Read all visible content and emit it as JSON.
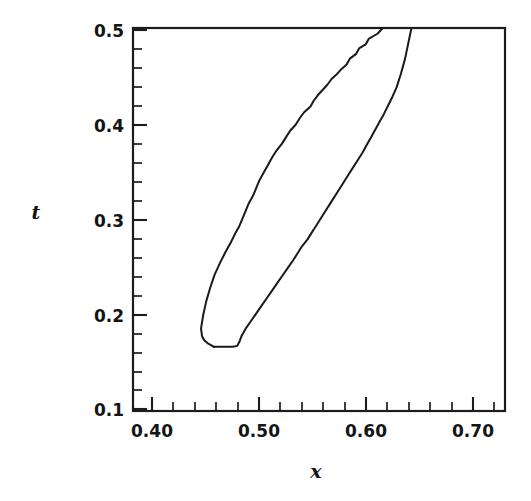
{
  "chart_data": {
    "type": "line",
    "title": "",
    "subtitle": "",
    "xlabel": "x",
    "ylabel": "t",
    "xlim": [
      0.37,
      0.72
    ],
    "ylim": [
      0.1,
      0.5
    ],
    "grid": false,
    "legend": null,
    "annotations": [],
    "x_tick_labels": [
      "0.40",
      "0.50",
      "0.60",
      "0.70"
    ],
    "x_tick_values": [
      0.4,
      0.5,
      0.6,
      0.7
    ],
    "y_tick_labels": [
      "0.1",
      "0.2",
      "0.3",
      "0.4",
      "0.5"
    ],
    "y_tick_values": [
      0.1,
      0.2,
      0.3,
      0.4,
      0.5
    ],
    "x_minor_per_interval": 4,
    "y_minor_per_interval": 4,
    "series": [
      {
        "name": "contour-left-branch",
        "comment": "left boundary of the band, traced from the top edge downward to the closed bottom tip",
        "x": [
          0.605,
          0.6,
          0.592,
          0.589,
          0.583,
          0.58,
          0.574,
          0.571,
          0.566,
          0.562,
          0.557,
          0.553,
          0.549,
          0.544,
          0.54,
          0.537,
          0.531,
          0.527,
          0.523,
          0.518,
          0.514,
          0.51,
          0.505,
          0.501,
          0.497,
          0.493,
          0.489,
          0.486,
          0.483,
          0.479,
          0.476,
          0.473,
          0.47,
          0.466,
          0.462,
          0.457,
          0.452,
          0.447,
          0.443,
          0.439,
          0.436,
          0.434,
          0.435,
          0.437,
          0.44,
          0.443,
          0.446
        ],
        "t": [
          0.5,
          0.494,
          0.489,
          0.483,
          0.479,
          0.473,
          0.468,
          0.462,
          0.457,
          0.452,
          0.447,
          0.441,
          0.436,
          0.43,
          0.424,
          0.418,
          0.412,
          0.406,
          0.399,
          0.393,
          0.386,
          0.379,
          0.372,
          0.365,
          0.357,
          0.349,
          0.341,
          0.333,
          0.325,
          0.317,
          0.309,
          0.301,
          0.293,
          0.285,
          0.276,
          0.266,
          0.255,
          0.243,
          0.23,
          0.215,
          0.2,
          0.186,
          0.178,
          0.174,
          0.171,
          0.169,
          0.167
        ]
      },
      {
        "name": "contour-right-branch",
        "comment": "right boundary of the band, traced from the closed bottom tip upward to the top edge",
        "x": [
          0.446,
          0.452,
          0.458,
          0.464,
          0.468,
          0.47,
          0.472,
          0.476,
          0.481,
          0.486,
          0.491,
          0.496,
          0.501,
          0.506,
          0.511,
          0.516,
          0.521,
          0.525,
          0.529,
          0.534,
          0.538,
          0.542,
          0.546,
          0.55,
          0.554,
          0.558,
          0.562,
          0.566,
          0.57,
          0.574,
          0.578,
          0.582,
          0.586,
          0.59,
          0.594,
          0.598,
          0.602,
          0.606,
          0.61,
          0.614,
          0.618,
          0.622,
          0.626,
          0.629,
          0.632
        ],
        "t": [
          0.167,
          0.167,
          0.167,
          0.167,
          0.168,
          0.172,
          0.178,
          0.186,
          0.194,
          0.202,
          0.21,
          0.218,
          0.226,
          0.234,
          0.242,
          0.25,
          0.258,
          0.265,
          0.272,
          0.279,
          0.286,
          0.293,
          0.3,
          0.307,
          0.314,
          0.321,
          0.328,
          0.335,
          0.342,
          0.349,
          0.356,
          0.363,
          0.37,
          0.378,
          0.386,
          0.394,
          0.402,
          0.41,
          0.419,
          0.428,
          0.438,
          0.452,
          0.468,
          0.484,
          0.5
        ]
      }
    ]
  },
  "figure": {
    "xlabel": "x",
    "ylabel": "t",
    "xticks": [
      "0.40",
      "0.50",
      "0.60",
      "0.70"
    ],
    "yticks": [
      "0.5",
      "0.4",
      "0.3",
      "0.2",
      "0.1"
    ],
    "line_color": "#1a1a1a",
    "frame_color": "#1c1c1c",
    "background_color": "#ffffff"
  }
}
